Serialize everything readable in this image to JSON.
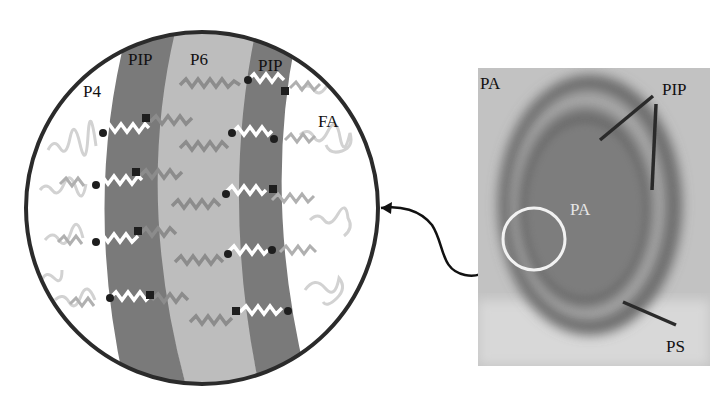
{
  "figure": {
    "type": "schematic-with-micrograph",
    "colors": {
      "background": "#ffffff",
      "circle_border": "#2b2b2b",
      "pip_band": "#7a7a7a",
      "p6_band": "#bdbdbd",
      "fa_region": "#ffffff",
      "peptide_gray": "#8c8c8c",
      "peptide_light": "#cfcfcf",
      "crosslink_white": "#ffffff",
      "anchor_dot": "#1e1e1e",
      "photo_bg": "#b8b8b8",
      "photo_dark_ring": "#5e5e5e",
      "inset_circle": "#f2f2f2"
    }
  },
  "schematic": {
    "labels": {
      "p4": "P4",
      "pip_left": "PIP",
      "p6": "P6",
      "pip_right": "PIP",
      "fa": "FA"
    }
  },
  "micrograph": {
    "labels": {
      "pa_corner": "PA",
      "pa_center": "PA",
      "pip": "PIP",
      "ps": "PS"
    }
  }
}
